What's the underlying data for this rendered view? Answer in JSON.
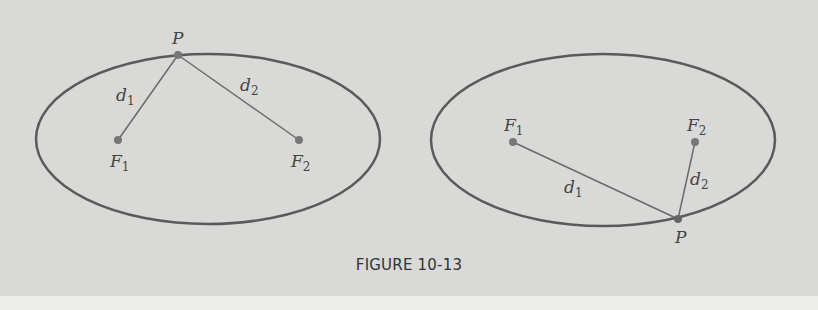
{
  "figure": {
    "caption": "FIGURE 10-13",
    "colors": {
      "background": "#d9d9d7",
      "curve": "#5a5a5a",
      "segment": "#6a6a6a",
      "point": "#777777",
      "label": "#444444"
    },
    "diagrams": [
      {
        "id": "left",
        "ellipse": {
          "cx": 208,
          "cy": 139,
          "rx": 172,
          "ry": 85
        },
        "points": {
          "F1": {
            "x": 118,
            "y": 140,
            "label": "F",
            "sub": "1"
          },
          "F2": {
            "x": 299,
            "y": 140,
            "label": "F",
            "sub": "2"
          },
          "P": {
            "x": 178,
            "y": 55,
            "label": "P"
          }
        },
        "segments": [
          {
            "from": "P",
            "to": "F1",
            "label": "d",
            "sub": "1"
          },
          {
            "from": "P",
            "to": "F2",
            "label": "d",
            "sub": "2"
          }
        ]
      },
      {
        "id": "right",
        "ellipse": {
          "cx": 603,
          "cy": 140,
          "rx": 172,
          "ry": 86
        },
        "points": {
          "F1": {
            "x": 513,
            "y": 142,
            "label": "F",
            "sub": "1"
          },
          "F2": {
            "x": 695,
            "y": 142,
            "label": "F",
            "sub": "2"
          },
          "P": {
            "x": 678,
            "y": 219,
            "label": "P"
          }
        },
        "segments": [
          {
            "from": "P",
            "to": "F1",
            "label": "d",
            "sub": "1"
          },
          {
            "from": "P",
            "to": "F2",
            "label": "d",
            "sub": "2"
          }
        ]
      }
    ]
  }
}
